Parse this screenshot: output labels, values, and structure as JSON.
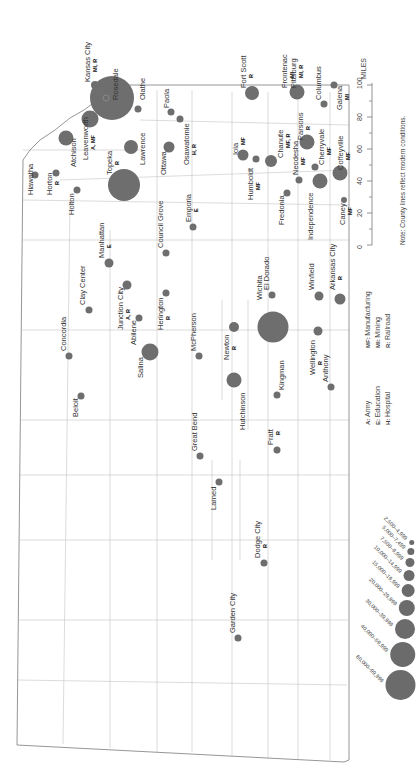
{
  "map": {
    "orientation": "rotated 90° clockwise",
    "dot_color": "#6e6e6e",
    "line_color": "#bdbdbd",
    "border_color": "#888888",
    "towns": [
      {
        "name": "Kansas City",
        "codes": "MI, R",
        "x": 95,
        "y": 85,
        "r": 4,
        "lx": 90,
        "ly": 82
      },
      {
        "name": "Rosedale",
        "codes": "",
        "x": 112,
        "y": 98,
        "r": 22,
        "lx": 118,
        "ly": 100
      },
      {
        "name": "Olathe",
        "codes": "",
        "x": 138,
        "y": 109,
        "r": 3.5,
        "lx": 145,
        "ly": 100
      },
      {
        "name": "Leavenworth",
        "codes": "A, MF",
        "x": 90,
        "y": 119,
        "r": 8.5,
        "lx": 88,
        "ly": 160
      },
      {
        "name": "Atchison",
        "codes": "",
        "x": 66,
        "y": 138,
        "r": 7.5,
        "lx": 76,
        "ly": 167
      },
      {
        "name": "Lawrence",
        "codes": "",
        "x": 131,
        "y": 147,
        "r": 7,
        "lx": 145,
        "ly": 165
      },
      {
        "name": "Paola",
        "codes": "",
        "x": 171,
        "y": 112,
        "r": 3.5,
        "lx": 169,
        "ly": 108
      },
      {
        "name": "Osawatomie",
        "codes": "H, R",
        "x": 180,
        "y": 119,
        "r": 3.5,
        "lx": 189,
        "ly": 165
      },
      {
        "name": "Ottawa",
        "codes": "",
        "x": 169,
        "y": 147,
        "r": 5.5,
        "lx": 166,
        "ly": 175
      },
      {
        "name": "Topeka",
        "codes": "R",
        "x": 124,
        "y": 185,
        "r": 16,
        "lx": 112,
        "ly": 175
      },
      {
        "name": "Hiawatha",
        "codes": "",
        "x": 35,
        "y": 175,
        "r": 3.5,
        "lx": 33,
        "ly": 195
      },
      {
        "name": "Horton",
        "codes": "R",
        "x": 56,
        "y": 173,
        "r": 3.5,
        "lx": 52,
        "ly": 195
      },
      {
        "name": "Holton",
        "codes": "",
        "x": 77,
        "y": 190,
        "r": 3.5,
        "lx": 74,
        "ly": 215
      },
      {
        "name": "Fort Scott",
        "codes": "R",
        "x": 252,
        "y": 93,
        "r": 7,
        "lx": 246,
        "ly": 88
      },
      {
        "name": "Frontenac",
        "codes": "MI",
        "x": 293,
        "y": 92,
        "r": 3,
        "lx": 287,
        "ly": 88
      },
      {
        "name": "Pittsburg",
        "codes": "MI, R",
        "x": 297,
        "y": 92,
        "r": 7.5,
        "lx": 296,
        "ly": 88
      },
      {
        "name": "Columbus",
        "codes": "",
        "x": 324,
        "y": 104,
        "r": 3.5,
        "lx": 321,
        "ly": 100
      },
      {
        "name": "Galena",
        "codes": "MI",
        "x": 334,
        "y": 85,
        "r": 3.5,
        "lx": 342,
        "ly": 110
      },
      {
        "name": "Iola",
        "codes": "MF",
        "x": 243,
        "y": 155,
        "r": 5.5,
        "lx": 238,
        "ly": 155
      },
      {
        "name": "Humboldt",
        "codes": "MF",
        "x": 256,
        "y": 159,
        "r": 3.5,
        "lx": 253,
        "ly": 200
      },
      {
        "name": "Chanute",
        "codes": "MF, R",
        "x": 271,
        "y": 161,
        "r": 6,
        "lx": 283,
        "ly": 158
      },
      {
        "name": "Parsons",
        "codes": "R",
        "x": 307,
        "y": 142,
        "r": 7.5,
        "lx": 303,
        "ly": 140
      },
      {
        "name": "Neodesha",
        "codes": "MF",
        "x": 299,
        "y": 180,
        "r": 3.5,
        "lx": 298,
        "ly": 175
      },
      {
        "name": "Cherryvale",
        "codes": "MF",
        "x": 315,
        "y": 167,
        "r": 3.5,
        "lx": 324,
        "ly": 165
      },
      {
        "name": "Coffeyville",
        "codes": "MF",
        "x": 340,
        "y": 173,
        "r": 7.5,
        "lx": 343,
        "ly": 170
      },
      {
        "name": "Independence",
        "codes": "",
        "x": 320,
        "y": 181,
        "r": 7.5,
        "lx": 313,
        "ly": 240
      },
      {
        "name": "Caney",
        "codes": "MF",
        "x": 344,
        "y": 200,
        "r": 3,
        "lx": 345,
        "ly": 225
      },
      {
        "name": "Fredonia",
        "codes": "",
        "x": 287,
        "y": 193,
        "r": 3.5,
        "lx": 284,
        "ly": 225
      },
      {
        "name": "Emporia",
        "codes": "E",
        "x": 193,
        "y": 227,
        "r": 3.5,
        "lx": 191,
        "ly": 222
      },
      {
        "name": "Council Grove",
        "codes": "",
        "x": 166,
        "y": 253,
        "r": 3.5,
        "lx": 163,
        "ly": 248
      },
      {
        "name": "Manhattan",
        "codes": "E",
        "x": 109,
        "y": 263,
        "r": 4.5,
        "lx": 104,
        "ly": 258
      },
      {
        "name": "Clay Center",
        "codes": "",
        "x": 89,
        "y": 310,
        "r": 3.5,
        "lx": 85,
        "ly": 305
      },
      {
        "name": "Junction City",
        "codes": "A, R",
        "x": 127,
        "y": 285,
        "r": 4.5,
        "lx": 123,
        "ly": 330
      },
      {
        "name": "Herington",
        "codes": "R",
        "x": 166,
        "y": 293,
        "r": 3.5,
        "lx": 163,
        "ly": 330
      },
      {
        "name": "Abilene",
        "codes": "",
        "x": 139,
        "y": 318,
        "r": 3.5,
        "lx": 136,
        "ly": 345
      },
      {
        "name": "Salina",
        "codes": "",
        "x": 150,
        "y": 352,
        "r": 8.5,
        "lx": 143,
        "ly": 378
      },
      {
        "name": "Concordia",
        "codes": "",
        "x": 69,
        "y": 356,
        "r": 3.5,
        "lx": 66,
        "ly": 351
      },
      {
        "name": "McPherson",
        "codes": "",
        "x": 199,
        "y": 356,
        "r": 3.5,
        "lx": 196,
        "ly": 351
      },
      {
        "name": "Beloit",
        "codes": "",
        "x": 81,
        "y": 396,
        "r": 3.5,
        "lx": 78,
        "ly": 417
      },
      {
        "name": "Newton",
        "codes": "R",
        "x": 234,
        "y": 327,
        "r": 5,
        "lx": 229,
        "ly": 360
      },
      {
        "name": "Wichita",
        "codes": "",
        "x": 273,
        "y": 327,
        "r": 15.5,
        "lx": 262,
        "ly": 300
      },
      {
        "name": "El Dorado",
        "codes": "",
        "x": 272,
        "y": 295,
        "r": 3.5,
        "lx": 269,
        "ly": 290
      },
      {
        "name": "Winfield",
        "codes": "",
        "x": 319,
        "y": 296,
        "r": 4.5,
        "lx": 314,
        "ly": 290
      },
      {
        "name": "Arkansas City",
        "codes": "R",
        "x": 340,
        "y": 299,
        "r": 5.5,
        "lx": 335,
        "ly": 290
      },
      {
        "name": "Wellington",
        "codes": "R",
        "x": 318,
        "y": 331,
        "r": 4.5,
        "lx": 315,
        "ly": 375
      },
      {
        "name": "Anthony",
        "codes": "",
        "x": 331,
        "y": 387,
        "r": 3.5,
        "lx": 328,
        "ly": 382
      },
      {
        "name": "Hutchinson",
        "codes": "",
        "x": 234,
        "y": 380,
        "r": 7.5,
        "lx": 245,
        "ly": 430
      },
      {
        "name": "Kingman",
        "codes": "",
        "x": 277,
        "y": 395,
        "r": 3.5,
        "lx": 284,
        "ly": 390
      },
      {
        "name": "Great Bend",
        "codes": "",
        "x": 200,
        "y": 456,
        "r": 3.5,
        "lx": 197,
        "ly": 451
      },
      {
        "name": "Pratt",
        "codes": "R",
        "x": 277,
        "y": 450,
        "r": 3.5,
        "lx": 273,
        "ly": 445
      },
      {
        "name": "Larned",
        "codes": "",
        "x": 219,
        "y": 482,
        "r": 3.5,
        "lx": 216,
        "ly": 510
      },
      {
        "name": "Dodge City",
        "codes": "R",
        "x": 264,
        "y": 563,
        "r": 3.5,
        "lx": 260,
        "ly": 558
      },
      {
        "name": "Garden City",
        "codes": "",
        "x": 238,
        "y": 638,
        "r": 3.5,
        "lx": 235,
        "ly": 633
      }
    ]
  },
  "legend": {
    "codes_col1": [
      {
        "code": "A",
        "label": "Army"
      },
      {
        "code": "E",
        "label": "Education"
      },
      {
        "code": "H",
        "label": "Hospital"
      }
    ],
    "codes_col2": [
      {
        "code": "MF",
        "label": "Manufacturing"
      },
      {
        "code": "MI",
        "label": "Mining"
      },
      {
        "code": "R",
        "label": "Railroad"
      }
    ],
    "sizes": [
      {
        "label": "2,500–4,999",
        "r": 2.5
      },
      {
        "label": "5,000–7,499",
        "r": 3.5
      },
      {
        "label": "7,500–9,999",
        "r": 4.5
      },
      {
        "label": "10,000–14,999",
        "r": 5.5
      },
      {
        "label": "15,000–19,999",
        "r": 6.5
      },
      {
        "label": "20,000–29,999",
        "r": 8
      },
      {
        "label": "30,000–39,999",
        "r": 10
      },
      {
        "label": "40,000–59,999",
        "r": 12.5
      },
      {
        "label": "60,000–99,999",
        "r": 15
      }
    ]
  },
  "scale": {
    "unit": "MILES",
    "ticks": [
      "0",
      "20",
      "40",
      "60",
      "80",
      "100"
    ]
  },
  "note": "Note: County lines reflect modern conditions."
}
